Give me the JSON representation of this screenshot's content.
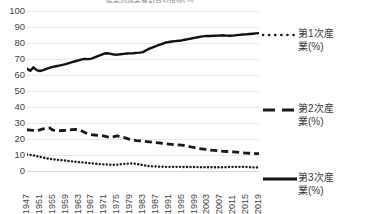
{
  "chart_data": {
    "type": "line",
    "title": "産業別就業者割合の推移(%)",
    "xlabel": "",
    "ylabel": "",
    "ylim": [
      0,
      100
    ],
    "ytick_step": 10,
    "yticks": [
      "100",
      "90",
      "80",
      "70",
      "60",
      "50",
      "40",
      "30",
      "20",
      "10",
      "0"
    ],
    "grid": true,
    "legend_position": "right",
    "x": [
      1947,
      1948,
      1949,
      1950,
      1951,
      1952,
      1953,
      1954,
      1955,
      1956,
      1957,
      1958,
      1959,
      1960,
      1961,
      1962,
      1963,
      1964,
      1965,
      1966,
      1967,
      1968,
      1969,
      1970,
      1971,
      1972,
      1973,
      1974,
      1975,
      1976,
      1977,
      1978,
      1979,
      1980,
      1981,
      1982,
      1983,
      1984,
      1985,
      1986,
      1987,
      1988,
      1989,
      1990,
      1991,
      1992,
      1993,
      1994,
      1995,
      1996,
      1997,
      1998,
      1999,
      2000,
      2001,
      2002,
      2003,
      2004,
      2005,
      2006,
      2007,
      2008,
      2009,
      2010,
      2011,
      2012,
      2013,
      2014,
      2015,
      2016,
      2017,
      2018,
      2019
    ],
    "xtick_labels": [
      "1947",
      "1951",
      "1955",
      "1959",
      "1963",
      "1967",
      "1971",
      "1975",
      "1979",
      "1983",
      "1987",
      "1991",
      "1995",
      "1999",
      "2003",
      "2007",
      "2011",
      "2015",
      "2019"
    ],
    "series": [
      {
        "name": "第1次産業(%)",
        "legend_label_line1": "第1次産",
        "legend_label_line2": "業(%)",
        "style": "dotted",
        "color": "#1a1a1a",
        "values": [
          10.3,
          10.0,
          9.8,
          9.3,
          8.8,
          8.4,
          8.0,
          7.6,
          7.3,
          7.1,
          6.9,
          6.7,
          6.5,
          6.2,
          6.0,
          5.8,
          5.6,
          5.4,
          5.2,
          5.0,
          4.8,
          4.6,
          4.4,
          4.2,
          4.1,
          4.0,
          3.9,
          3.9,
          4.0,
          4.2,
          4.4,
          4.6,
          4.7,
          4.6,
          4.4,
          4.1,
          3.7,
          3.3,
          3.0,
          2.9,
          2.8,
          2.7,
          2.7,
          2.6,
          2.6,
          2.6,
          2.6,
          2.6,
          2.6,
          2.5,
          2.5,
          2.5,
          2.5,
          2.4,
          2.4,
          2.4,
          2.4,
          2.4,
          2.3,
          2.3,
          2.3,
          2.3,
          2.4,
          2.5,
          2.6,
          2.6,
          2.6,
          2.6,
          2.5,
          2.4,
          2.3,
          2.2,
          2.1
        ]
      },
      {
        "name": "第2次産業(%)",
        "legend_label_line1": "第2次産",
        "legend_label_line2": "業(%)",
        "style": "dashed",
        "color": "#1a1a1a",
        "values": [
          25.8,
          25.6,
          25.4,
          25.2,
          25.7,
          26.3,
          26.7,
          26.9,
          25.6,
          25.3,
          25.2,
          25.3,
          25.4,
          25.6,
          25.8,
          26.0,
          25.7,
          25.0,
          24.0,
          23.2,
          22.8,
          22.5,
          22.3,
          22.2,
          21.8,
          21.3,
          21.0,
          21.5,
          22.0,
          21.5,
          21.0,
          20.4,
          19.7,
          19.3,
          19.0,
          18.8,
          18.6,
          18.4,
          18.2,
          18.0,
          17.8,
          17.6,
          17.3,
          17.0,
          16.8,
          16.6,
          16.4,
          16.3,
          16.2,
          15.8,
          15.4,
          15.0,
          14.6,
          14.2,
          13.9,
          13.6,
          13.3,
          13.1,
          12.9,
          12.7,
          12.5,
          12.3,
          12.2,
          12.1,
          12.0,
          11.8,
          11.6,
          11.4,
          11.2,
          11.1,
          11.0,
          10.9,
          10.8
        ]
      },
      {
        "name": "第3次産業(%)",
        "legend_label_line1": "第3次産",
        "legend_label_line2": "業(%)",
        "style": "solid",
        "color": "#111111",
        "values": [
          63.9,
          62.6,
          64.8,
          63.0,
          62.5,
          63.0,
          63.8,
          64.5,
          65.1,
          65.5,
          65.9,
          66.3,
          66.8,
          67.4,
          68.0,
          68.6,
          69.2,
          69.8,
          70.1,
          69.9,
          70.2,
          71.0,
          71.8,
          72.6,
          73.4,
          73.6,
          73.2,
          72.8,
          72.7,
          73.0,
          73.2,
          73.4,
          73.5,
          73.6,
          73.8,
          74.0,
          74.3,
          75.5,
          76.5,
          77.3,
          78.0,
          78.8,
          79.5,
          80.2,
          80.6,
          80.9,
          81.2,
          81.4,
          81.6,
          82.0,
          82.4,
          82.8,
          83.2,
          83.6,
          84.0,
          84.3,
          84.4,
          84.4,
          84.5,
          84.6,
          84.7,
          84.8,
          84.6,
          84.5,
          84.6,
          84.9,
          85.1,
          85.3,
          85.4,
          85.6,
          85.8,
          86.0,
          86.2
        ]
      }
    ]
  }
}
